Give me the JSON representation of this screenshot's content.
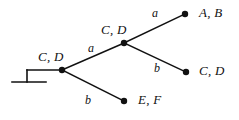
{
  "diagram": {
    "stroke_color": "#111111",
    "background_color": "#ffffff",
    "node_radius": 3.2,
    "nodes": [
      {
        "id": "root",
        "label": "C, D",
        "x": 62,
        "y": 70,
        "label_x": 38,
        "label_y": 50,
        "kind": "internal"
      },
      {
        "id": "middle",
        "label": "C, D",
        "x": 124,
        "y": 43,
        "label_x": 101,
        "label_y": 23,
        "kind": "internal"
      },
      {
        "id": "leaf-top",
        "label": "A, B",
        "x": 185,
        "y": 14,
        "label_x": 199,
        "label_y": 6,
        "kind": "leaf"
      },
      {
        "id": "leaf-middle",
        "label": "C, D",
        "x": 186,
        "y": 72,
        "label_x": 199,
        "label_y": 64,
        "kind": "leaf"
      },
      {
        "id": "leaf-bottom",
        "label": "E, F",
        "x": 124,
        "y": 101,
        "label_x": 138,
        "label_y": 93,
        "kind": "leaf"
      }
    ],
    "edges": [
      {
        "id": "root-to-middle",
        "from": "root",
        "to": "middle",
        "label": "a",
        "label_x": 88,
        "label_y": 42
      },
      {
        "id": "root-to-leaf-bottom",
        "from": "root",
        "to": "leaf-bottom",
        "label": "b",
        "label_x": 85,
        "label_y": 94
      },
      {
        "id": "middle-to-leaf-top",
        "from": "middle",
        "to": "leaf-top",
        "label": "a",
        "label_x": 152,
        "label_y": 7
      },
      {
        "id": "middle-to-leaf-mid",
        "from": "middle",
        "to": "leaf-middle",
        "label": "b",
        "label_x": 154,
        "label_y": 62
      }
    ],
    "ground": {
      "lead_x1": 27,
      "lead_y": 70,
      "lead_x2": 62,
      "stem_x": 27,
      "stem_y1": 70,
      "stem_y2": 82,
      "base_x1": 12,
      "base_x2": 46,
      "base_y": 82
    }
  }
}
